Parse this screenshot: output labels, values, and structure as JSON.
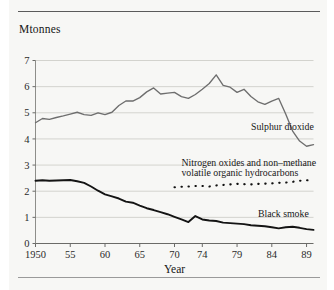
{
  "figure": {
    "unit_label": "Mtonnes",
    "has_top_rule": true,
    "has_bottom_rule": true,
    "background_color": "#f7f7f5"
  },
  "chart_data": {
    "type": "line",
    "title": "",
    "subtitle": "",
    "xlabel": "Year",
    "ylabel": "Mtonnes",
    "xlim": [
      1950,
      1990
    ],
    "ylim": [
      0,
      7
    ],
    "grid": true,
    "grid_axis": "y",
    "legend_position": "inline-annotations",
    "x_tick_labels": [
      "1950",
      "55",
      "60",
      "65",
      "70",
      "74",
      "79",
      "84",
      "89"
    ],
    "x_tick_values": [
      1950,
      1955,
      1960,
      1965,
      1970,
      1974,
      1979,
      1984,
      1989
    ],
    "y_tick_labels": [
      "0",
      "1",
      "2",
      "3",
      "4",
      "5",
      "6",
      "7"
    ],
    "y_tick_values": [
      0,
      1,
      2,
      3,
      4,
      5,
      6,
      7
    ],
    "series": [
      {
        "name": "Sulphur dioxide",
        "style": "solid",
        "color": "#6e6e6e",
        "label_anchor_year": 1981,
        "label_anchor_value": 4.35,
        "x": [
          1950,
          1951,
          1952,
          1953,
          1954,
          1955,
          1956,
          1957,
          1958,
          1959,
          1960,
          1961,
          1962,
          1963,
          1964,
          1965,
          1966,
          1967,
          1968,
          1969,
          1970,
          1971,
          1972,
          1973,
          1974,
          1975,
          1976,
          1977,
          1978,
          1979,
          1980,
          1981,
          1982,
          1983,
          1984,
          1985,
          1986,
          1987,
          1988,
          1989,
          1990
        ],
        "values": [
          4.62,
          4.78,
          4.75,
          4.82,
          4.88,
          4.95,
          5.02,
          4.93,
          4.9,
          5.0,
          4.93,
          5.02,
          5.28,
          5.45,
          5.45,
          5.58,
          5.8,
          5.95,
          5.72,
          5.75,
          5.78,
          5.62,
          5.55,
          5.7,
          5.9,
          6.12,
          6.45,
          6.05,
          5.98,
          5.78,
          5.9,
          5.62,
          5.42,
          5.32,
          5.45,
          5.55,
          4.95,
          4.3,
          3.92,
          3.72,
          3.78
        ],
        "values_tail": [
          3.95,
          4.02,
          3.95,
          3.88
        ]
      },
      {
        "name": "Nitrogen oxides and non–methane volatile organic hydrocarbons",
        "style": "dotted",
        "color": "#111111",
        "label_anchor_year": 1971,
        "label_anchor_value": 2.95,
        "x": [
          1970,
          1971,
          1972,
          1973,
          1974,
          1975,
          1976,
          1977,
          1978,
          1979,
          1980,
          1981,
          1982,
          1983,
          1984,
          1985,
          1986,
          1987,
          1988,
          1989,
          1990
        ],
        "values": [
          2.15,
          2.17,
          2.18,
          2.2,
          2.2,
          2.18,
          2.22,
          2.24,
          2.26,
          2.28,
          2.27,
          2.26,
          2.28,
          2.29,
          2.3,
          2.32,
          2.33,
          2.36,
          2.4,
          2.42,
          2.4
        ]
      },
      {
        "name": "Black smoke",
        "style": "solid-thick",
        "color": "#141414",
        "label_anchor_year": 1982,
        "label_anchor_value": 1.02,
        "x": [
          1950,
          1951,
          1952,
          1953,
          1954,
          1955,
          1956,
          1957,
          1958,
          1959,
          1960,
          1961,
          1962,
          1963,
          1964,
          1965,
          1966,
          1967,
          1968,
          1969,
          1970,
          1971,
          1972,
          1973,
          1974,
          1975,
          1976,
          1977,
          1978,
          1979,
          1980,
          1981,
          1982,
          1983,
          1984,
          1985,
          1986,
          1987,
          1988,
          1989,
          1990
        ],
        "values": [
          2.4,
          2.42,
          2.4,
          2.41,
          2.42,
          2.43,
          2.38,
          2.32,
          2.18,
          2.02,
          1.88,
          1.8,
          1.72,
          1.6,
          1.56,
          1.45,
          1.35,
          1.28,
          1.2,
          1.12,
          1.02,
          0.92,
          0.82,
          1.05,
          0.92,
          0.88,
          0.86,
          0.8,
          0.78,
          0.76,
          0.74,
          0.7,
          0.68,
          0.66,
          0.62,
          0.58,
          0.62,
          0.64,
          0.6,
          0.55,
          0.52
        ]
      }
    ]
  }
}
